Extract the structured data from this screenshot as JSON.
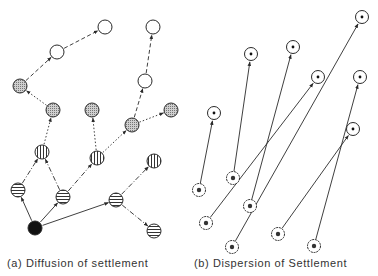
{
  "panel_a": {
    "caption": "(a) Diffusion of settlement",
    "caption_x": 7,
    "nodes": [
      {
        "id": "a0",
        "x": 35,
        "y": 228,
        "fill": "black"
      },
      {
        "id": "a1",
        "x": 18,
        "y": 190,
        "fill": "hstripe"
      },
      {
        "id": "a2",
        "x": 63,
        "y": 197,
        "fill": "hstripe"
      },
      {
        "id": "a3",
        "x": 116,
        "y": 200,
        "fill": "hstripe"
      },
      {
        "id": "a4",
        "x": 154,
        "y": 231,
        "fill": "hstripe"
      },
      {
        "id": "a5",
        "x": 42,
        "y": 152,
        "fill": "vstripe"
      },
      {
        "id": "a6",
        "x": 97,
        "y": 158,
        "fill": "vstripe"
      },
      {
        "id": "a7",
        "x": 154,
        "y": 161,
        "fill": "vstripe"
      },
      {
        "id": "a8",
        "x": 20,
        "y": 86,
        "fill": "dot"
      },
      {
        "id": "a9",
        "x": 53,
        "y": 110,
        "fill": "dot"
      },
      {
        "id": "a10",
        "x": 92,
        "y": 110,
        "fill": "dot"
      },
      {
        "id": "a11",
        "x": 132,
        "y": 125,
        "fill": "dot"
      },
      {
        "id": "a12",
        "x": 171,
        "y": 110,
        "fill": "dot"
      },
      {
        "id": "a13",
        "x": 57,
        "y": 52,
        "fill": "white"
      },
      {
        "id": "a14",
        "x": 105,
        "y": 27,
        "fill": "white"
      },
      {
        "id": "a15",
        "x": 145,
        "y": 81,
        "fill": "white"
      },
      {
        "id": "a16",
        "x": 153,
        "y": 27,
        "fill": "white"
      }
    ],
    "edges": [
      {
        "from": "a0",
        "to": "a1",
        "style": "solid"
      },
      {
        "from": "a0",
        "to": "a2",
        "style": "solid"
      },
      {
        "from": "a0",
        "to": "a3",
        "style": "solid"
      },
      {
        "from": "a3",
        "to": "a4",
        "style": "dashdot"
      },
      {
        "from": "a3",
        "to": "a7",
        "style": "dashdot"
      },
      {
        "from": "a1",
        "to": "a5",
        "style": "dashdot"
      },
      {
        "from": "a2",
        "to": "a5",
        "style": "dashdot"
      },
      {
        "from": "a2",
        "to": "a6",
        "style": "dashdot"
      },
      {
        "from": "a5",
        "to": "a9",
        "style": "dotted"
      },
      {
        "from": "a6",
        "to": "a10",
        "style": "dotted"
      },
      {
        "from": "a6",
        "to": "a11",
        "style": "dotted"
      },
      {
        "from": "a11",
        "to": "a12",
        "style": "dotted"
      },
      {
        "from": "a9",
        "to": "a8",
        "style": "dotted"
      },
      {
        "from": "a8",
        "to": "a13",
        "style": "dashed"
      },
      {
        "from": "a13",
        "to": "a14",
        "style": "dashed"
      },
      {
        "from": "a11",
        "to": "a15",
        "style": "dashed"
      },
      {
        "from": "a15",
        "to": "a16",
        "style": "dashed"
      }
    ]
  },
  "panel_b": {
    "caption": "(b) Dispersion of Settlement",
    "caption_x": 194,
    "sources": [
      {
        "id": "s0",
        "x": 199,
        "y": 190
      },
      {
        "id": "s1",
        "x": 233,
        "y": 178
      },
      {
        "id": "s2",
        "x": 206,
        "y": 223
      },
      {
        "id": "s3",
        "x": 250,
        "y": 206
      },
      {
        "id": "s4",
        "x": 232,
        "y": 247
      },
      {
        "id": "s5",
        "x": 278,
        "y": 234
      },
      {
        "id": "s6",
        "x": 314,
        "y": 246
      }
    ],
    "destinations": [
      {
        "id": "d0",
        "x": 214,
        "y": 113
      },
      {
        "id": "d1",
        "x": 251,
        "y": 54
      },
      {
        "id": "d2",
        "x": 293,
        "y": 47
      },
      {
        "id": "d3",
        "x": 318,
        "y": 77
      },
      {
        "id": "d4",
        "x": 362,
        "y": 17
      },
      {
        "id": "d5",
        "x": 360,
        "y": 77
      },
      {
        "id": "d6",
        "x": 353,
        "y": 129
      }
    ],
    "arrows": [
      {
        "from": "s0",
        "to": "d0"
      },
      {
        "from": "s1",
        "to": "d1"
      },
      {
        "from": "s3",
        "to": "d2"
      },
      {
        "from": "s2",
        "to": "d3"
      },
      {
        "from": "s4",
        "to": "d4"
      },
      {
        "from": "s6",
        "to": "d5"
      },
      {
        "from": "s5",
        "to": "d6"
      }
    ]
  },
  "colors": {
    "ink": "#2a2a2a",
    "fill_dot": "#bdbdbd",
    "bg": "#ffffff"
  }
}
